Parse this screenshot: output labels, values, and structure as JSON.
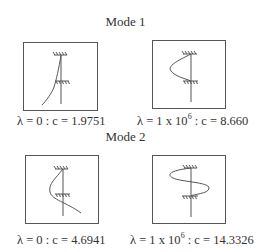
{
  "modes": [
    {
      "title": "Mode 1",
      "panels": [
        {
          "lambda_label": "λ = 0 : c = 1.9751",
          "lambda": "0",
          "c": "1.9751",
          "shape": "single-curve-tilted"
        },
        {
          "lambda_prefix": "λ = 1 x 10",
          "lambda_exp": "6",
          "lambda_suffix": " : c = 8.660",
          "lambda": "1 x 10^6",
          "c": "8.660",
          "shape": "half-wave-bulge"
        }
      ]
    },
    {
      "title": "Mode 2",
      "panels": [
        {
          "lambda_label": "λ = 0 : c = 4.6941",
          "lambda": "0",
          "c": "4.6941",
          "shape": "bulge-then-sweep"
        },
        {
          "lambda_prefix": "λ = 1 x 10",
          "lambda_exp": "6",
          "lambda_suffix": " : c = 14.3326",
          "lambda": "1 x 10^6",
          "c": "14.3326",
          "shape": "full-wave-s"
        }
      ]
    }
  ],
  "colors": {
    "line": "#555555",
    "text": "#333333",
    "background": "#ffffff"
  }
}
